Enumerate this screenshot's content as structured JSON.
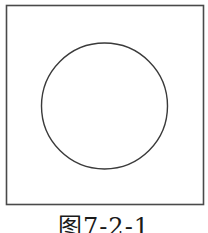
{
  "figure": {
    "caption": "图7-2-1",
    "square": {
      "x": 6.5,
      "y": 5.5,
      "width": 197,
      "height": 199,
      "stroke": "#4a4a4a",
      "stroke_width": 1.6
    },
    "circle": {
      "cx": 104.5,
      "cy": 106,
      "r": 63,
      "stroke": "#3a3a3a",
      "stroke_width": 1.4
    },
    "colors": {
      "background": "#ffffff",
      "line": "#3a3a3a",
      "text": "#1a1a1a"
    }
  }
}
